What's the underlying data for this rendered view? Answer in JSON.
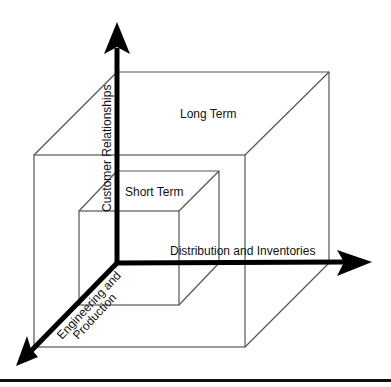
{
  "diagram": {
    "type": "3d-cube-axes",
    "axes": {
      "vertical": {
        "label": "Customer Relationships"
      },
      "horizontal": {
        "label": "Distribution and Inventories"
      },
      "depth": {
        "label_line1": "Engineering and",
        "label_line2": "Production"
      }
    },
    "regions": {
      "outer_cube": {
        "label": "Long Term"
      },
      "inner_cube": {
        "label": "Short Term"
      }
    },
    "colors": {
      "axis": "#000000",
      "edge": "#555555",
      "text": "#111111",
      "background": "#ffffff"
    }
  }
}
